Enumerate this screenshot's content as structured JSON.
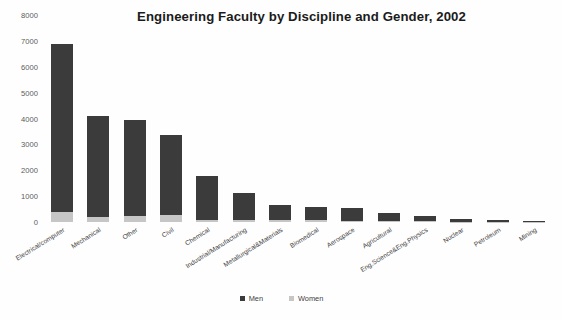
{
  "chart_data": {
    "type": "bar",
    "subtype": "stacked-vertical",
    "title": "Engineering Faculty by Discipline and Gender, 2002",
    "xlabel": "",
    "ylabel": "",
    "ylim": [
      0,
      8000
    ],
    "yticks": [
      8000,
      7000,
      6000,
      5000,
      4000,
      3000,
      2000,
      1000,
      0
    ],
    "ytick_labels": [
      "8000",
      "7000",
      "6000",
      "5000",
      "4000",
      "3000",
      "2000",
      "1000",
      "0"
    ],
    "grid": false,
    "legend_position": "bottom",
    "categories": [
      "Electrical/computer",
      "Mechanical",
      "Other",
      "Civil",
      "Chemical",
      "Industrial/Manufacturing",
      "Metallurgical&Materials",
      "Biomedical",
      "Aerospace",
      "Agricultural",
      "Eng.Science&Eng.Physics",
      "Nuclear",
      "Petroleum",
      "Mining"
    ],
    "series": [
      {
        "name": "Men",
        "color": "#3b3b3b",
        "values": [
          6480,
          3900,
          3690,
          3100,
          1690,
          1060,
          600,
          520,
          530,
          300,
          210,
          100,
          85,
          40
        ]
      },
      {
        "name": "Women",
        "color": "#c6c6c6",
        "values": [
          400,
          200,
          250,
          260,
          90,
          60,
          60,
          60,
          30,
          30,
          20,
          10,
          5,
          5
        ]
      }
    ],
    "totals": [
      6880,
      4100,
      3940,
      3360,
      1780,
      1120,
      660,
      580,
      560,
      330,
      230,
      110,
      90,
      45
    ]
  },
  "legend": {
    "items": [
      {
        "label": "Men",
        "color": "#3b3b3b"
      },
      {
        "label": "Women",
        "color": "#c6c6c6"
      }
    ]
  }
}
